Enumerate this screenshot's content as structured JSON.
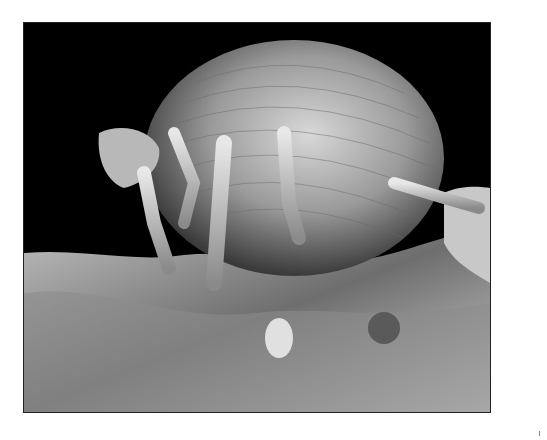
{
  "image": {
    "subject": "scanning electron micrograph of a dust mite",
    "background_color": "#000000",
    "page_background": "#ffffff"
  }
}
